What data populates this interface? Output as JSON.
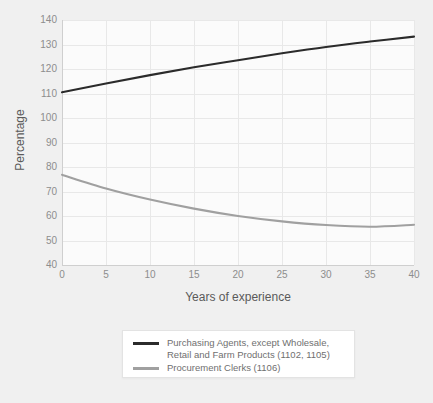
{
  "chart_data": {
    "type": "line",
    "title": "",
    "xlabel": "Years of experience",
    "ylabel": "Percentage",
    "xlim": [
      0,
      40
    ],
    "ylim": [
      40,
      140
    ],
    "xticks": [
      0,
      5,
      10,
      15,
      20,
      25,
      30,
      35,
      40
    ],
    "yticks": [
      40,
      50,
      60,
      70,
      80,
      90,
      100,
      110,
      120,
      130,
      140
    ],
    "grid": true,
    "legend_position": "bottom-center",
    "x": [
      0,
      5,
      10,
      15,
      20,
      25,
      30,
      35,
      40
    ],
    "series": [
      {
        "name": "Purchasing Agents, except Wholesale,\nRetail and Farm Products (1102, 1105)",
        "color": "#2b2b2b",
        "values": [
          110.5,
          114.1,
          117.5,
          120.7,
          123.6,
          126.4,
          129.0,
          131.2,
          133.2
        ]
      },
      {
        "name": "Procurement Clerks (1106)",
        "color": "#a0a0a0",
        "values": [
          76.8,
          71.2,
          66.7,
          63.0,
          60.0,
          57.8,
          56.3,
          55.6,
          56.4
        ]
      }
    ]
  },
  "axes": {
    "x_title": "Years of experience",
    "y_title": "Percentage",
    "x_tick_labels": [
      "0",
      "5",
      "10",
      "15",
      "20",
      "25",
      "30",
      "35",
      "40"
    ],
    "y_tick_labels": [
      "140",
      "130",
      "120",
      "110",
      "100",
      "90",
      "80",
      "70",
      "60",
      "50",
      "40"
    ]
  },
  "legend": {
    "entries": [
      {
        "label": "Purchasing Agents, except Wholesale,\nRetail and Farm Products (1102, 1105)",
        "color": "#2b2b2b"
      },
      {
        "label": "Procurement Clerks (1106)",
        "color": "#a0a0a0"
      }
    ]
  },
  "colors": {
    "background": "#f0f0f0",
    "plot_background": "#fbfbfb",
    "grid": "#e8e8e8",
    "axis": "#cfcfcf",
    "tick_text": "#8d8d8d",
    "title_text": "#5a5a5a",
    "legend_text": "#6f6f6f",
    "legend_border": "#e3e3e3"
  }
}
